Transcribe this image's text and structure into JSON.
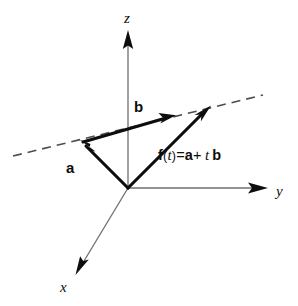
{
  "figure": {
    "background_color": "#ffffff",
    "ink_color": "#0d0d0d",
    "axis_color": "#6b6b6b",
    "vector_color": "#0d0d0d",
    "dashed_color": "#4d4d4d",
    "width": 298,
    "height": 306
  },
  "axes": [
    {
      "name": "z-axis",
      "label": "z",
      "label_x": 124,
      "label_y": 11,
      "x1": 128,
      "y1": 188,
      "x2": 128,
      "y2": 40,
      "tip_x": 128,
      "tip_y": 31
    },
    {
      "name": "y-axis",
      "label": "y",
      "label_x": 276,
      "label_y": 184,
      "x1": 128,
      "y1": 188,
      "x2": 256,
      "y2": 188,
      "tip_x": 267,
      "tip_y": 188
    },
    {
      "name": "x-axis",
      "label": "x",
      "label_x": 60,
      "label_y": 280,
      "x1": 128,
      "y1": 188,
      "x2": 82,
      "y2": 264,
      "tip_x": 76,
      "tip_y": 274
    }
  ],
  "origin": {
    "x": 128,
    "y": 188
  },
  "vectors": [
    {
      "name": "vector-a",
      "label": "a",
      "label_x": 66,
      "label_y": 160,
      "from_x": 128,
      "from_y": 188,
      "to_x": 84,
      "to_y": 144,
      "tip_x": 81,
      "tip_y": 141
    },
    {
      "name": "vector-b",
      "label": "b",
      "label_x": 134,
      "label_y": 99,
      "from_x": 82,
      "from_y": 142,
      "to_x": 166,
      "to_y": 118,
      "tip_x": 174,
      "tip_y": 116
    },
    {
      "name": "vector-ft",
      "label": "",
      "from_x": 128,
      "from_y": 188,
      "to_x": 202,
      "to_y": 114,
      "tip_x": 209,
      "tip_y": 107
    }
  ],
  "dashed_line": {
    "name": "parametric-line",
    "x1": 13,
    "y1": 156,
    "x2": 263,
    "y2": 95,
    "dash_pattern": "9 6"
  },
  "equation": {
    "name": "equation-ft",
    "full_text": "f(t)=a+ t b",
    "f": "f",
    "open_paren": "(",
    "t_arg": "t",
    "close_paren": ")",
    "equals": "=",
    "a": "a",
    "plus": "+",
    "t_scalar": "t",
    "b": "b",
    "x": 158,
    "y": 148
  }
}
